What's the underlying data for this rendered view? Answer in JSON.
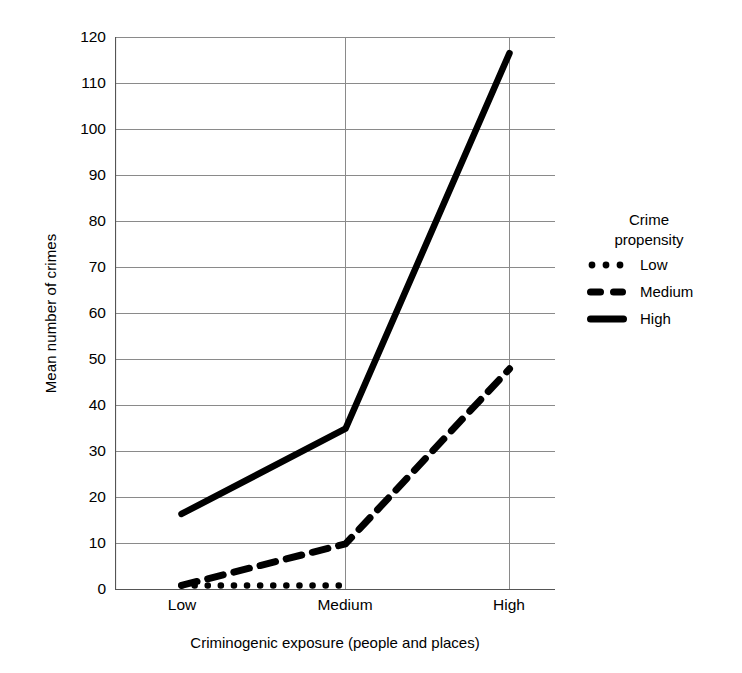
{
  "chart_data": {
    "type": "line",
    "title": "",
    "xlabel": "Criminogenic exposure (people and places)",
    "ylabel": "Mean number of crimes",
    "categories": [
      "Low",
      "Medium",
      "High"
    ],
    "x": [
      0,
      1,
      2
    ],
    "ylim": [
      0,
      120
    ],
    "yticks": [
      0,
      10,
      20,
      30,
      40,
      50,
      60,
      70,
      80,
      90,
      100,
      110,
      120
    ],
    "ytick_labels": [
      "0",
      "10",
      "20",
      "30",
      "40",
      "50",
      "60",
      "70",
      "80",
      "90",
      "100",
      "110",
      "120"
    ],
    "xtick_labels": [
      "Low",
      "Medium",
      "High"
    ],
    "grid": "horizontal",
    "legend_position": "right",
    "legend_title": "Crime propensity",
    "series": [
      {
        "name": "Low",
        "style": "dotted",
        "color": "#000000",
        "values": [
          1,
          1,
          null
        ],
        "note": "flat near 1, line ends just past Medium"
      },
      {
        "name": "Medium",
        "style": "dashed",
        "color": "#000000",
        "values": [
          1,
          10,
          48
        ]
      },
      {
        "name": "High",
        "style": "solid",
        "color": "#000000",
        "values": [
          16.5,
          35,
          116.5
        ]
      }
    ]
  },
  "legend": {
    "title_line_1": "Crime",
    "title_line_2": "propensity",
    "entries": [
      {
        "label": "Low",
        "marker": "dotted-line-sample"
      },
      {
        "label": "Medium",
        "marker": "dashed-line-sample"
      },
      {
        "label": "High",
        "marker": "solid-line-sample"
      }
    ]
  },
  "axes": {
    "y_title": "Mean number of crimes",
    "x_title": "Criminogenic exposure (people and places)"
  }
}
